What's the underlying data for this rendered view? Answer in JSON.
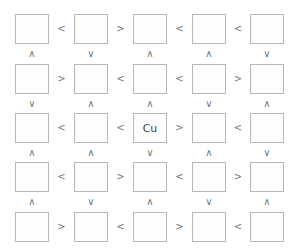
{
  "puzzle": {
    "rows": 5,
    "cols": 5,
    "cells": [
      [
        "",
        "",
        "",
        "",
        ""
      ],
      [
        "",
        "",
        "",
        "",
        ""
      ],
      [
        "",
        "",
        "Cu",
        "",
        ""
      ],
      [
        "",
        "",
        "",
        "",
        ""
      ],
      [
        "",
        "",
        "",
        "",
        ""
      ]
    ],
    "horizontal_signs": [
      [
        "<",
        ">",
        "<",
        "<"
      ],
      [
        ">",
        "<",
        "<",
        ">"
      ],
      [
        "<",
        "<",
        ">",
        "<"
      ],
      [
        "<",
        ">",
        "<",
        ">"
      ],
      [
        ">",
        "<",
        ">",
        "<"
      ]
    ],
    "vertical_signs": [
      [
        "^",
        "v",
        "^",
        "^",
        "v"
      ],
      [
        "v",
        "^",
        "^",
        "v",
        "^"
      ],
      [
        "^",
        "^",
        "v",
        "^",
        "v"
      ],
      [
        "^",
        "v",
        "^",
        "v",
        "^"
      ]
    ]
  }
}
